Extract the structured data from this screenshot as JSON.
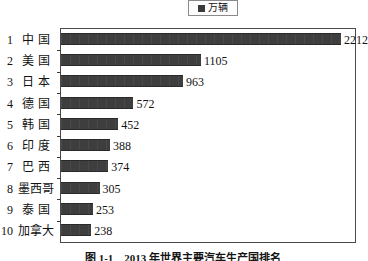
{
  "legend": {
    "label": "万辆",
    "marker_icon": "filled-square-icon",
    "marker_color": "#3a3a3a"
  },
  "caption": {
    "text": "图 1-1　2013 年世界主要汽车生产国排名"
  },
  "axis": {
    "origin_x_px": 60,
    "px_per_unit": 0.1266,
    "tick_icon": "axis-tick-mark"
  },
  "chart_data": {
    "type": "bar",
    "orientation": "horizontal",
    "title": "",
    "xlabel": "",
    "ylabel": "",
    "unit": "万辆",
    "grid": false,
    "legend_position": "top-center",
    "legend_entries": [
      "万辆"
    ],
    "xlim": [
      0,
      2340
    ],
    "categories": [
      "中  国",
      "美  国",
      "日  本",
      "德  国",
      "韩  国",
      "印  度",
      "巴  西",
      "墨西哥",
      "泰  国",
      "加拿大"
    ],
    "ranks": [
      1,
      2,
      3,
      4,
      5,
      6,
      7,
      8,
      9,
      10
    ],
    "values": [
      2212,
      1105,
      963,
      572,
      452,
      388,
      374,
      305,
      253,
      238
    ],
    "value_labels": [
      "2212",
      "1105",
      "963",
      "572",
      "452",
      "388",
      "374",
      "305",
      "253",
      "238"
    ],
    "bar_color": "#3e3e3e"
  }
}
